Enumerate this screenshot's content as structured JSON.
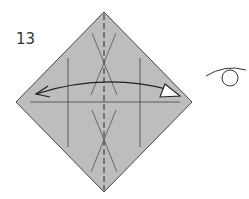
{
  "diagram": {
    "step_number": "13",
    "paper_color": "#bdbdbd",
    "line_color": "#333333",
    "instruction_symbols": [
      "fold-and-unfold-arrow",
      "valley-fold-line",
      "turn-over-symbol"
    ]
  }
}
